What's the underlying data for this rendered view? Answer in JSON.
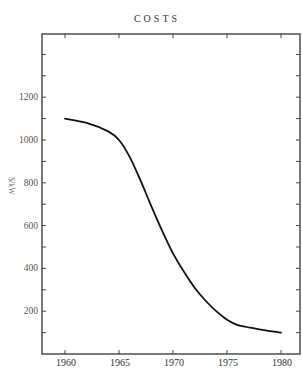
{
  "chart_data": {
    "type": "line",
    "title": "COSTS",
    "xlabel": "",
    "ylabel": "$/kW",
    "xlim": [
      1958.9,
      1981.8
    ],
    "ylim": [
      0,
      1500
    ],
    "x_ticks": [
      1960,
      1965,
      1970,
      1975,
      1980
    ],
    "x_tick_labels": [
      "1960",
      "1965",
      "1970",
      "1975",
      "1980"
    ],
    "y_ticks": [
      200,
      400,
      600,
      800,
      1000,
      1200
    ],
    "y_tick_labels": [
      "200",
      "400",
      "600",
      "800",
      "1000",
      "1200"
    ],
    "grid": false,
    "legend": null,
    "series": [
      {
        "name": "Costs",
        "x": [
          1960,
          1962,
          1964,
          1965,
          1966,
          1967,
          1968,
          1969,
          1970,
          1971,
          1972,
          1973,
          1974,
          1975,
          1976,
          1977,
          1978,
          1979,
          1980
        ],
        "values": [
          1100,
          1080,
          1040,
          1000,
          920,
          810,
          690,
          575,
          470,
          385,
          310,
          250,
          200,
          160,
          135,
          125,
          115,
          107,
          100
        ]
      }
    ]
  },
  "layout": {
    "frame": {
      "left": 42,
      "right": 300,
      "top": 34,
      "bottom": 354
    },
    "x_px": {
      "1960": 65,
      "1980": 281
    },
    "y_px_zero": 354,
    "y_px_per_unit": 0.214
  }
}
